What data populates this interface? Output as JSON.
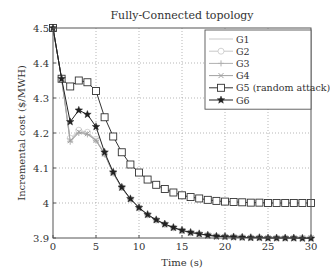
{
  "chart_data": {
    "type": "line",
    "title": "Fully-Connected topology",
    "xlabel": "Time (s)",
    "ylabel": "Incremental cost ($/MWH)",
    "xlim": [
      0,
      30
    ],
    "ylim": [
      3.9,
      4.5
    ],
    "xticks": [
      0,
      5,
      10,
      15,
      20,
      25,
      30
    ],
    "yticks": [
      3.9,
      4.0,
      4.1,
      4.2,
      4.3,
      4.4,
      4.5
    ],
    "ytick_labels": [
      "3.9",
      "4",
      "4.1",
      "4.2",
      "4.3",
      "4.4",
      "4.5"
    ],
    "grid": true,
    "legend_position": "upper right",
    "x": [
      0,
      1,
      2,
      3,
      4,
      5,
      6,
      7,
      8,
      9,
      10,
      11,
      12,
      13,
      14,
      15,
      16,
      17,
      18,
      19,
      20,
      21,
      22,
      23,
      24,
      25,
      26,
      27,
      28,
      29,
      30
    ],
    "series": [
      {
        "name": "G1",
        "color": "#c8c8c8",
        "marker": "none",
        "values": [
          4.5,
          4.355,
          4.18,
          4.205,
          4.2,
          4.18,
          4.14,
          4.085,
          4.043,
          4.011,
          3.986,
          3.966,
          3.951,
          3.939,
          3.929,
          3.921,
          3.915,
          3.911,
          3.908,
          3.905,
          3.904,
          3.903,
          3.902,
          3.901,
          3.901,
          3.9,
          3.9,
          3.9,
          3.9,
          3.9,
          3.9
        ]
      },
      {
        "name": "G2",
        "color": "#c8c8c8",
        "marker": "circle",
        "values": [
          4.5,
          4.355,
          4.185,
          4.208,
          4.202,
          4.182,
          4.141,
          4.086,
          4.044,
          4.011,
          3.986,
          3.966,
          3.951,
          3.939,
          3.929,
          3.921,
          3.915,
          3.911,
          3.908,
          3.905,
          3.904,
          3.903,
          3.902,
          3.901,
          3.901,
          3.9,
          3.9,
          3.9,
          3.9,
          3.9,
          3.9
        ]
      },
      {
        "name": "G3",
        "color": "#b0b0b0",
        "marker": "plus",
        "values": [
          4.5,
          4.355,
          4.175,
          4.2,
          4.196,
          4.178,
          4.139,
          4.085,
          4.043,
          4.011,
          3.986,
          3.966,
          3.951,
          3.939,
          3.929,
          3.921,
          3.915,
          3.911,
          3.908,
          3.905,
          3.904,
          3.903,
          3.902,
          3.901,
          3.901,
          3.9,
          3.9,
          3.9,
          3.9,
          3.9,
          3.9
        ]
      },
      {
        "name": "G4",
        "color": "#a0a0a0",
        "marker": "x",
        "values": [
          4.5,
          4.355,
          4.178,
          4.203,
          4.198,
          4.179,
          4.14,
          4.085,
          4.043,
          4.011,
          3.986,
          3.966,
          3.951,
          3.939,
          3.929,
          3.921,
          3.915,
          3.911,
          3.908,
          3.905,
          3.904,
          3.903,
          3.902,
          3.901,
          3.901,
          3.9,
          3.9,
          3.9,
          3.9,
          3.9,
          3.9
        ]
      },
      {
        "name": "G5 (random attack)",
        "color": "#333333",
        "marker": "square",
        "values": [
          4.5,
          4.355,
          4.333,
          4.35,
          4.345,
          4.32,
          4.245,
          4.19,
          4.145,
          4.11,
          4.087,
          4.067,
          4.052,
          4.04,
          4.03,
          4.022,
          4.017,
          4.013,
          4.009,
          4.006,
          4.004,
          4.003,
          4.002,
          4.001,
          4.001,
          4.0,
          4.0,
          4.0,
          4.0,
          4.0,
          4.0
        ]
      },
      {
        "name": "G6",
        "color": "#222222",
        "marker": "star",
        "values": [
          4.5,
          4.355,
          4.232,
          4.265,
          4.253,
          4.218,
          4.145,
          4.088,
          4.045,
          4.012,
          3.987,
          3.967,
          3.952,
          3.94,
          3.93,
          3.922,
          3.916,
          3.912,
          3.908,
          3.905,
          3.904,
          3.903,
          3.902,
          3.901,
          3.901,
          3.9,
          3.9,
          3.9,
          3.9,
          3.899,
          3.899
        ]
      }
    ]
  }
}
